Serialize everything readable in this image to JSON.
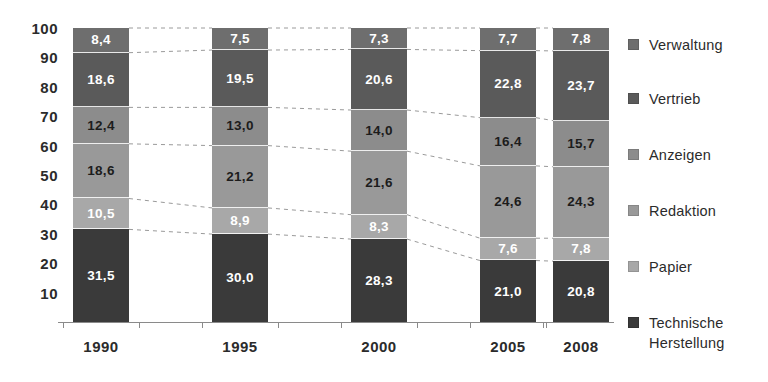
{
  "chart_data": {
    "type": "bar",
    "subtype": "stacked-100-percent",
    "title": "",
    "subtitle": "",
    "xlabel": "",
    "ylabel": "",
    "categories": [
      "1990",
      "1995",
      "2000",
      "2005",
      "2008"
    ],
    "ylim": [
      0,
      100
    ],
    "yticks": [
      10,
      20,
      30,
      40,
      50,
      60,
      70,
      80,
      90,
      100
    ],
    "ytick_labels": [
      "10",
      "20",
      "30",
      "40",
      "50",
      "60",
      "70",
      "80",
      "90",
      "100"
    ],
    "grid": false,
    "legend_position": "right",
    "decimal_separator": ",",
    "stack_order": "bottom-to-top",
    "connectors": true,
    "series": [
      {
        "name": "Technische Herstellung",
        "color": "#3a3a3a",
        "text_color": "light",
        "values": [
          31.5,
          30.0,
          28.3,
          21.0,
          20.8
        ],
        "labels": [
          "31,5",
          "30,0",
          "28,3",
          "21,0",
          "20,8"
        ]
      },
      {
        "name": "Papier",
        "color": "#a8a8a8",
        "text_color": "light",
        "values": [
          10.5,
          8.9,
          8.3,
          7.6,
          7.8
        ],
        "labels": [
          "10,5",
          "8,9",
          "8,3",
          "7,6",
          "7,8"
        ]
      },
      {
        "name": "Redaktion",
        "color": "#999999",
        "text_color": "dark",
        "values": [
          18.6,
          21.2,
          21.6,
          24.6,
          24.3
        ],
        "labels": [
          "18,6",
          "21,2",
          "21,6",
          "24,6",
          "24,3"
        ]
      },
      {
        "name": "Anzeigen",
        "color": "#8c8c8c",
        "text_color": "dark",
        "values": [
          12.4,
          13.0,
          14.0,
          16.4,
          15.7
        ],
        "labels": [
          "12,4",
          "13,0",
          "14,0",
          "16,4",
          "15,7"
        ]
      },
      {
        "name": "Vertrieb",
        "color": "#5a5a5a",
        "text_color": "light",
        "values": [
          18.6,
          19.5,
          20.6,
          22.8,
          23.7
        ],
        "labels": [
          "18,6",
          "19,5",
          "20,6",
          "22,8",
          "23,7"
        ]
      },
      {
        "name": "Verwaltung",
        "color": "#6e6e6e",
        "text_color": "light",
        "values": [
          8.4,
          7.5,
          7.3,
          7.7,
          7.8
        ],
        "labels": [
          "8,4",
          "7,5",
          "7,3",
          "7,7",
          "7,8"
        ]
      }
    ]
  },
  "legend": {
    "items": [
      {
        "label": "Verwaltung",
        "color": "#6e6e6e"
      },
      {
        "label": "Vertrieb",
        "color": "#5a5a5a"
      },
      {
        "label": "Anzeigen",
        "color": "#8c8c8c"
      },
      {
        "label": "Redaktion",
        "color": "#999999"
      },
      {
        "label": "Papier",
        "color": "#a8a8a8"
      },
      {
        "label": "Technische\nHerstellung",
        "color": "#3a3a3a"
      }
    ]
  },
  "axes": {
    "y_tick_labels": [
      "100",
      "90",
      "80",
      "70",
      "60",
      "50",
      "40",
      "30",
      "20",
      "10"
    ],
    "x_tick_labels": [
      "1990",
      "1995",
      "2000",
      "2005",
      "2008"
    ]
  }
}
